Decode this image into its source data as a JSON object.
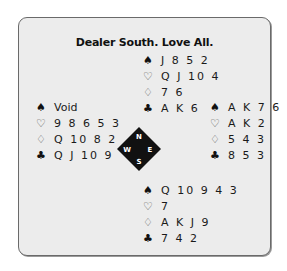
{
  "title": "Dealer South. Love All.",
  "suits": {
    "spades": "♠",
    "hearts": "♡",
    "diamonds": "♢",
    "clubs": "♣"
  },
  "hands": {
    "north": {
      "spades": "J 8 5 2",
      "hearts": "Q J 10 4",
      "diamonds": "7 6",
      "clubs": "A K 6"
    },
    "west": {
      "spades": "Void",
      "hearts": "9 8 6 5 3",
      "diamonds": "Q 10 8 2",
      "clubs": "Q J 10 9"
    },
    "east": {
      "spades": "A K 7 6",
      "hearts": "A K 2",
      "diamonds": "5 4 3",
      "clubs": "8 5 3"
    },
    "south": {
      "spades": "Q 10 9 4 3",
      "hearts": "7",
      "diamonds": "A K J 9",
      "clubs": "7 4 2"
    }
  },
  "compass": {
    "n": "N",
    "w": "W",
    "e": "E",
    "s": "S"
  },
  "colors": {
    "panel": "#ececec",
    "border": "#6a6a6a",
    "compass": "#111111"
  }
}
